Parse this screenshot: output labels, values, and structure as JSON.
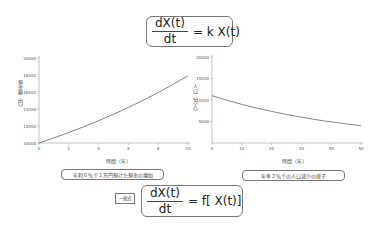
{
  "equations": {
    "top": {
      "numerator": "dX(t)",
      "denominator": "dt",
      "rhs": "= k X(t)"
    },
    "bottom": {
      "tag": "一般式",
      "numerator": "dX(t)",
      "denominator": "dt",
      "rhs": "= f[ X(t)]"
    }
  },
  "left_chart": {
    "caption": "年利６％で１万円預けた預金の増加",
    "xlabel": "時間（年）",
    "ylabel": "預金額（円）"
  },
  "right_chart": {
    "caption": "年率２％での人口減少の様子",
    "xlabel": "時間（年）",
    "ylabel": "人口（万人）"
  },
  "chart_data": [
    {
      "type": "line",
      "title": "年利６％で１万円預けた預金の増加",
      "xlabel": "時間（年）",
      "ylabel": "預金額（円）",
      "x": [
        0,
        1,
        2,
        3,
        4,
        5,
        6,
        7,
        8,
        9,
        10
      ],
      "series": [
        {
          "name": "預金額",
          "values": [
            10000,
            10600,
            11236,
            11910,
            12625,
            13382,
            14185,
            15036,
            15938,
            16895,
            17908
          ]
        }
      ],
      "xticks": [
        0,
        2,
        4,
        6,
        8,
        10
      ],
      "yticks": [
        10000,
        12000,
        14000,
        16000,
        18000,
        20000
      ],
      "xlim": [
        0,
        10
      ],
      "ylim": [
        10000,
        20000
      ],
      "grid": false
    },
    {
      "type": "line",
      "title": "年率２％での人口減少の様子",
      "xlabel": "時間（年）",
      "ylabel": "人口（万人）",
      "x": [
        0,
        5,
        10,
        15,
        20,
        25,
        30,
        35,
        40,
        45,
        50
      ],
      "series": [
        {
          "name": "人口",
          "values": [
            11000,
            9944,
            8988,
            8125,
            7345,
            6639,
            6002,
            5425,
            4904,
            4433,
            4008
          ]
        }
      ],
      "xticks": [
        0,
        10,
        20,
        30,
        40,
        50
      ],
      "yticks": [
        5000,
        10000,
        15000,
        20000
      ],
      "xlim": [
        0,
        50
      ],
      "ylim": [
        0,
        20000
      ],
      "grid": false
    }
  ]
}
